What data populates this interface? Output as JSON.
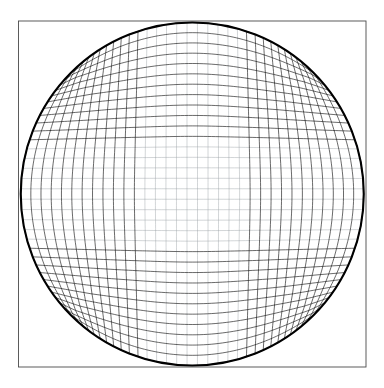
{
  "figure": {
    "type": "mesh-diagram",
    "width": 384,
    "height": 388,
    "background_color": "#ffffff"
  },
  "chart_data": {
    "type": "line",
    "title": "",
    "xlabel": "",
    "ylabel": "",
    "grid": true,
    "legend": null,
    "symmetry": "4-fold",
    "square": {
      "left": 18.5,
      "top": 21.0,
      "right": 366.0,
      "bottom": 367.0,
      "stroke": "#4a4a4a",
      "stroke_width": 0.9
    },
    "circle": {
      "center_x": 192.25,
      "center_y": 194.0,
      "radius": 171.5,
      "stroke": "#000000",
      "stroke_width": 2.1,
      "tangent_to_square_edges": true
    },
    "mesh": {
      "divisions": 33,
      "interior_stroke": "#9aa0a6",
      "interior_stroke_width": 0.45,
      "outer_stroke": "#0d0d0d",
      "outer_stroke_width": 0.62,
      "blend_exponent": 2.6,
      "samples_per_line": 90,
      "families": [
        "u-constant",
        "v-constant"
      ]
    }
  }
}
